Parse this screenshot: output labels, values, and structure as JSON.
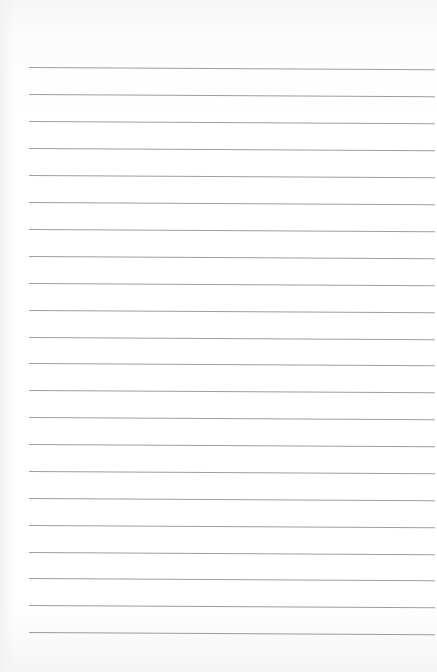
{
  "page": {
    "type": "lined-paper",
    "background_color": "#ffffff",
    "line_color": "#8c8c8c",
    "line_count": 22,
    "line_positions_y": [
      67,
      94,
      121,
      148,
      175,
      202,
      229,
      256,
      283,
      310,
      337,
      363,
      390,
      417,
      444,
      471,
      498,
      525,
      552,
      578,
      605,
      632
    ]
  }
}
